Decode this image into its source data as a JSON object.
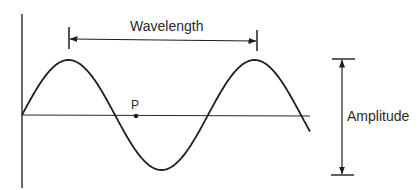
{
  "diagram": {
    "type": "transverse-wave",
    "labels": {
      "wavelength": "Wavelength",
      "amplitude": "Amplitude",
      "point": "P"
    },
    "colors": {
      "line": "#1e1e1e",
      "axis": "#2a2a2a",
      "background": "#ffffff"
    },
    "wave": {
      "shape": "sine",
      "origin_px": [
        22,
        115
      ],
      "period_px": 186,
      "amplitude_px": 55,
      "end_x_px": 310,
      "peaks_px": [
        [
          68,
          60
        ],
        [
          254,
          60
        ]
      ],
      "trough_px": [
        161,
        170
      ]
    },
    "annotations": {
      "wavelength_span": "peak to peak",
      "amplitude_span": "peak to trough",
      "point_on_axis": "P"
    }
  }
}
